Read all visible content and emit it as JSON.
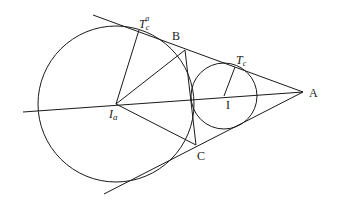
{
  "diagram": {
    "stroke_color": "#1a1a1a",
    "background": "#ffffff",
    "points": {
      "A": {
        "label": "A",
        "x": 303,
        "y": 92
      },
      "B": {
        "label": "B",
        "x": 185,
        "y": 50
      },
      "C": {
        "label": "C",
        "x": 196,
        "y": 145
      },
      "I": {
        "label": "I",
        "x": 224,
        "y": 96
      },
      "Ia": {
        "label": "I",
        "sub": "a",
        "x": 116,
        "y": 104
      },
      "Tc": {
        "label": "T",
        "sub": "c",
        "x": 236,
        "y": 67
      },
      "Tca": {
        "label": "T",
        "sub": "c",
        "sup": "a",
        "x": 138,
        "y": 32
      }
    },
    "circles": [
      {
        "name": "excircle",
        "cx": 116,
        "cy": 104,
        "r": 78
      },
      {
        "name": "incircle",
        "cx": 224,
        "cy": 96,
        "r": 33
      }
    ],
    "labels": {
      "A": "A",
      "B": "B",
      "C": "C",
      "I": "I",
      "Ia_main": "I",
      "Ia_sub": "a",
      "Tc_main": "T",
      "Tc_sub": "c",
      "Tca_main": "T",
      "Tca_sub": "c",
      "Tca_sup": "a"
    }
  }
}
